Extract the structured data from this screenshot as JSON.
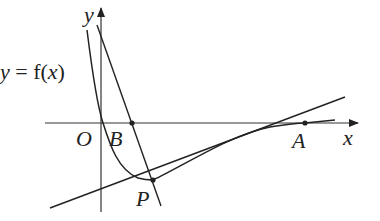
{
  "diagram": {
    "type": "function-graph",
    "function_label_var": "y",
    "function_label_eq": " = f(",
    "function_label_arg": "x",
    "function_label_close": ")",
    "axes": {
      "x_label": "x",
      "y_label": "y",
      "origin_label": "O"
    },
    "points": [
      {
        "name": "B",
        "label": "B",
        "description": "intersection of line BP with x-axis"
      },
      {
        "name": "P",
        "label": "P",
        "description": "point on curve, tangent point"
      },
      {
        "name": "A",
        "label": "A",
        "description": "intersection of curve with x-axis"
      }
    ],
    "lines": [
      {
        "name": "line-BP",
        "through": [
          "B",
          "P"
        ]
      },
      {
        "name": "line-AP",
        "through": [
          "A",
          "P"
        ]
      }
    ],
    "colors": {
      "stroke": "#222222",
      "background": "#ffffff"
    }
  }
}
